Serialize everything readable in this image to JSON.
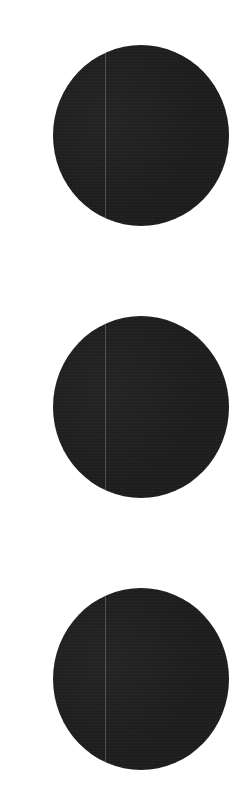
{
  "icon": {
    "name": "vertical-ellipsis-icon",
    "label": "More options",
    "glyph": "⋮",
    "dot_count": 3,
    "dot_color": "#1c1c1c",
    "background_color": "#ffffff"
  }
}
